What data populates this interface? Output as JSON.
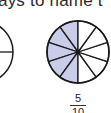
{
  "header": {
    "text": "ays to name t"
  },
  "figure": {
    "sectors_total": 10,
    "sectors_shaded": 5,
    "shade_color": "#c9cdea",
    "stroke_color": "#1a1a1a"
  },
  "fraction": {
    "numerator": "5",
    "denominator": "10"
  }
}
